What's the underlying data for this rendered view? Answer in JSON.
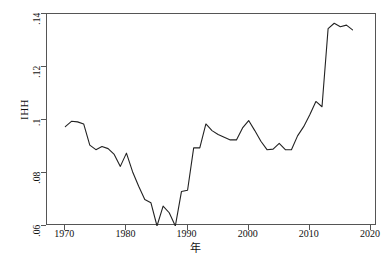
{
  "chart_data": {
    "type": "line",
    "title": "",
    "subtitle": "",
    "xlabel": "年",
    "ylabel": "IHH",
    "xlim": [
      1967,
      2021
    ],
    "ylim": [
      0.06,
      0.14
    ],
    "grid": false,
    "legend": null,
    "x_ticks": [
      "1970",
      "1980",
      "1990",
      "2000",
      "2010",
      "2020"
    ],
    "x_tick_values": [
      1970,
      1980,
      1990,
      2000,
      2010,
      2020
    ],
    "y_ticks": [
      ".06",
      ".08",
      ".1",
      ".12",
      ".14"
    ],
    "y_tick_values": [
      0.06,
      0.08,
      0.1,
      0.12,
      0.14
    ],
    "line_color": "#222222",
    "series": [
      {
        "name": "IHH",
        "x": [
          1970,
          1971,
          1972,
          1973,
          1974,
          1975,
          1976,
          1977,
          1978,
          1979,
          1980,
          1981,
          1982,
          1983,
          1984,
          1985,
          1986,
          1987,
          1988,
          1989,
          1990,
          1991,
          1992,
          1993,
          1994,
          1995,
          1996,
          1997,
          1998,
          1999,
          2000,
          2001,
          2002,
          2003,
          2004,
          2005,
          2006,
          2007,
          2008,
          2009,
          2010,
          2011,
          2012,
          2013,
          2014,
          2015,
          2016,
          2017
        ],
        "values": [
          0.0975,
          0.0995,
          0.0993,
          0.0985,
          0.0905,
          0.0888,
          0.09,
          0.0892,
          0.087,
          0.0825,
          0.0875,
          0.0805,
          0.075,
          0.07,
          0.0688,
          0.06,
          0.0675,
          0.065,
          0.06,
          0.073,
          0.0735,
          0.0895,
          0.0895,
          0.0985,
          0.096,
          0.0945,
          0.0935,
          0.0925,
          0.0925,
          0.097,
          0.0998,
          0.096,
          0.092,
          0.0888,
          0.089,
          0.0912,
          0.0888,
          0.0888,
          0.094,
          0.0975,
          0.102,
          0.107,
          0.105,
          0.1345,
          0.1365,
          0.1352,
          0.1358,
          0.134
        ]
      }
    ]
  }
}
